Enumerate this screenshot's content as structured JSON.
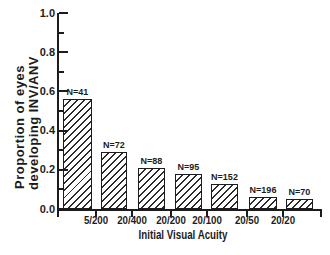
{
  "chart_data": {
    "type": "bar",
    "title": "",
    "xlabel": "Initial Visual Acuity",
    "ylabel": "Proportion of eyes developing INV/ANV",
    "ylabel_lines": [
      "Proportion of eyes",
      "developing INV/ANV"
    ],
    "x_tick_labels": [
      "5/200",
      "20/400",
      "20/200",
      "20/100",
      "20/50",
      "20/20"
    ],
    "y_tick_labels": [
      "0.0",
      "0.2",
      "0.4",
      "0.6",
      "0.8",
      "1.0"
    ],
    "y_minor_tick_interval": 0.1,
    "ylim": [
      0,
      1
    ],
    "grid": false,
    "legend": null,
    "bars": [
      {
        "label": "N=41",
        "value": 0.56
      },
      {
        "label": "N=72",
        "value": 0.29
      },
      {
        "label": "N=88",
        "value": 0.21
      },
      {
        "label": "N=95",
        "value": 0.18
      },
      {
        "label": "N=152",
        "value": 0.13
      },
      {
        "label": "N=196",
        "value": 0.06
      },
      {
        "label": "N=70",
        "value": 0.05
      }
    ],
    "bar_style": {
      "fill": "#ffffff",
      "hatch": "diagonal-forward",
      "line_color": "#1c1c1c"
    },
    "colors": {
      "axis": "#1c1c1c",
      "text": "#1c1c1c",
      "background": "#ffffff"
    }
  }
}
